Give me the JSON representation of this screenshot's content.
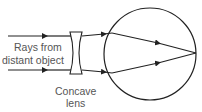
{
  "diagram": {
    "labels": {
      "rays_line1": "Rays from",
      "rays_line2": "distant object",
      "lens_line1": "Concave",
      "lens_line2": "lens"
    },
    "colors": {
      "stroke": "#222222",
      "text": "#555555"
    }
  }
}
